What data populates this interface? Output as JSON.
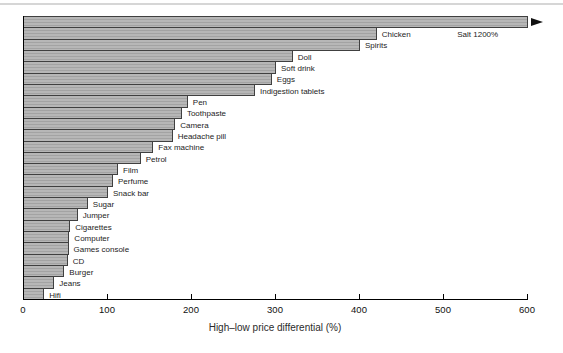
{
  "figure": {
    "background": "#ffffff",
    "top_rule_color": "#d6d6d6"
  },
  "chart_data": {
    "type": "bar",
    "orientation": "horizontal",
    "title": "",
    "xlabel": "High–low price differential (%)",
    "ylabel": "",
    "xlim": [
      0,
      600
    ],
    "x_ticks": [
      0,
      100,
      200,
      300,
      400,
      500,
      600
    ],
    "grid": false,
    "legend": "none",
    "bar_color": "#b7b7b7",
    "bar_stripe_color": "#a3a3a3",
    "bar_border_color": "#404040",
    "bars": [
      {
        "label": "Salt",
        "value": 1200,
        "drawn_to": 600,
        "overflow_arrow": true,
        "label_next_to_bar": false
      },
      {
        "label": "Chicken",
        "value": 420
      },
      {
        "label": "Spirits",
        "value": 400
      },
      {
        "label": "Doll",
        "value": 320
      },
      {
        "label": "Soft drink",
        "value": 300
      },
      {
        "label": "Eggs",
        "value": 295
      },
      {
        "label": "Indigestion tablets",
        "value": 275
      },
      {
        "label": "Pen",
        "value": 195
      },
      {
        "label": "Toothpaste",
        "value": 188
      },
      {
        "label": "Camera",
        "value": 180
      },
      {
        "label": "Headache pill",
        "value": 177
      },
      {
        "label": "Fax machine",
        "value": 154
      },
      {
        "label": "Petrol",
        "value": 139
      },
      {
        "label": "Film",
        "value": 112
      },
      {
        "label": "Perfume",
        "value": 106
      },
      {
        "label": "Snack bar",
        "value": 100
      },
      {
        "label": "Sugar",
        "value": 76
      },
      {
        "label": "Jumper",
        "value": 64
      },
      {
        "label": "Cigarettes",
        "value": 55
      },
      {
        "label": "Computer",
        "value": 54
      },
      {
        "label": "Games console",
        "value": 53
      },
      {
        "label": "CD",
        "value": 52
      },
      {
        "label": "Burger",
        "value": 48
      },
      {
        "label": "Jeans",
        "value": 36
      },
      {
        "label": "Hifi",
        "value": 24
      }
    ],
    "annotations": [
      {
        "text": "Salt 1200%",
        "row_index": 1,
        "x_value": 517
      }
    ]
  }
}
